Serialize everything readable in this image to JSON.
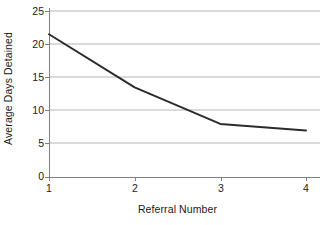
{
  "chart_data": {
    "type": "line",
    "title": "",
    "xlabel": "Referral Number",
    "ylabel": "Average Days Detained",
    "x": [
      1,
      2,
      3,
      4
    ],
    "values": [
      21.5,
      13.5,
      8.0,
      7.0
    ],
    "xtick_labels": [
      "1",
      "2",
      "3",
      "4"
    ],
    "ytick_labels": [
      "0",
      "5",
      "10",
      "15",
      "20",
      "25"
    ],
    "yticks": [
      0,
      5,
      10,
      15,
      20,
      25
    ],
    "xlim": [
      1,
      4
    ],
    "ylim": [
      0,
      25
    ],
    "grid": "horizontal",
    "legend": "none",
    "line_color": "#2b2b2b",
    "grid_color": "#b5b5b5",
    "axis_color": "#808080",
    "background_color": "#ffffff"
  },
  "axes": {
    "y_title": "Average Days Detained",
    "x_title": "Referral Number",
    "y_ticks": [
      {
        "label": "25",
        "value": 25
      },
      {
        "label": "20",
        "value": 20
      },
      {
        "label": "15",
        "value": 15
      },
      {
        "label": "10",
        "value": 10
      },
      {
        "label": "5",
        "value": 5
      },
      {
        "label": "0",
        "value": 0
      }
    ],
    "x_ticks": [
      {
        "label": "1",
        "value": 1
      },
      {
        "label": "2",
        "value": 2
      },
      {
        "label": "3",
        "value": 3
      },
      {
        "label": "4",
        "value": 4
      }
    ]
  }
}
